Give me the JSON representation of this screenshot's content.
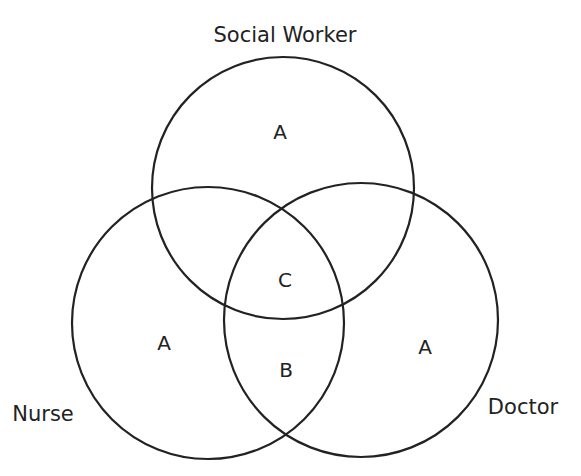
{
  "diagram": {
    "type": "venn",
    "sets": [
      {
        "id": "social_worker",
        "label": "Social Worker",
        "cx": 283,
        "cy": 188,
        "r": 131,
        "label_x": 285,
        "label_y": 42
      },
      {
        "id": "nurse",
        "label": "Nurse",
        "cx": 208,
        "cy": 323,
        "r": 136,
        "label_x": 43,
        "label_y": 421
      },
      {
        "id": "doctor",
        "label": "Doctor",
        "cx": 361,
        "cy": 320,
        "r": 137,
        "label_x": 523,
        "label_y": 414
      }
    ],
    "regions": [
      {
        "id": "social_worker_only",
        "label": "A",
        "x": 280,
        "y": 139
      },
      {
        "id": "nurse_only",
        "label": "A",
        "x": 164,
        "y": 350
      },
      {
        "id": "doctor_only",
        "label": "A",
        "x": 425,
        "y": 354
      },
      {
        "id": "all_three",
        "label": "C",
        "x": 285,
        "y": 287
      },
      {
        "id": "nurse_doctor",
        "label": "B",
        "x": 286,
        "y": 377
      }
    ],
    "stroke_color": "#222222",
    "background": "#ffffff"
  }
}
